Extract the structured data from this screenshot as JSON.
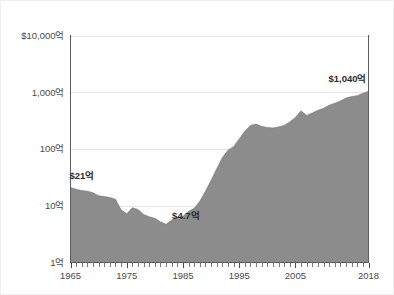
{
  "figure": {
    "background_color": "#ffffff",
    "plot_area_background": "#ffffff"
  },
  "chart_data": {
    "type": "area",
    "title": "",
    "subtitle": "",
    "xlabel": "",
    "ylabel": "",
    "yscale": "log",
    "ylim": [
      1,
      10000
    ],
    "xlim": [
      1965,
      2018
    ],
    "grid": true,
    "grid_axis": "y",
    "legend": false,
    "legend_position": "none",
    "series_color": "#8c8c8c",
    "x_tick_labels": [
      "1965",
      "1975",
      "1985",
      "1995",
      "2005",
      "2018"
    ],
    "x_tick_values": [
      1965,
      1975,
      1985,
      1995,
      2005,
      2018
    ],
    "y_tick_labels": [
      "$10,000억",
      "1,000억",
      "100억",
      "10억",
      "1억"
    ],
    "y_tick_values": [
      10000,
      1000,
      100,
      10,
      1
    ],
    "minor_tick_count_x": 53,
    "annotations": [
      {
        "text": "$21억",
        "x": 1965,
        "y": 21,
        "position": "above-left"
      },
      {
        "text": "$4.7억",
        "x": 1982,
        "y": 4.7,
        "position": "above-right"
      },
      {
        "text": "$1,040억",
        "x": 2018,
        "y": 1040,
        "position": "above-left"
      }
    ],
    "x": [
      1965,
      1966,
      1967,
      1968,
      1969,
      1970,
      1971,
      1972,
      1973,
      1974,
      1975,
      1976,
      1977,
      1978,
      1979,
      1980,
      1981,
      1982,
      1983,
      1984,
      1985,
      1986,
      1987,
      1988,
      1989,
      1990,
      1991,
      1992,
      1993,
      1994,
      1995,
      1996,
      1997,
      1998,
      1999,
      2000,
      2001,
      2002,
      2003,
      2004,
      2005,
      2006,
      2007,
      2008,
      2009,
      2010,
      2011,
      2012,
      2013,
      2014,
      2015,
      2016,
      2017,
      2018
    ],
    "values": [
      21,
      19.5,
      18.5,
      18.0,
      17.0,
      15.0,
      14.5,
      14.0,
      13.0,
      8.5,
      7.2,
      9.2,
      8.6,
      7.0,
      6.4,
      6.0,
      5.2,
      4.7,
      5.6,
      6.3,
      6.5,
      8.0,
      9.0,
      12.0,
      18.0,
      28.0,
      45.0,
      70.0,
      95.0,
      110.0,
      150.0,
      205.0,
      260.0,
      275.0,
      250.0,
      240.0,
      235.0,
      245.0,
      260.0,
      300.0,
      360.0,
      470.0,
      390.0,
      430.0,
      480.0,
      520.0,
      590.0,
      640.0,
      700.0,
      790.0,
      840.0,
      870.0,
      960.0,
      1040.0
    ],
    "series": [
      {
        "name": "값",
        "color": "#8c8c8c",
        "values": [
          21,
          19.5,
          18.5,
          18.0,
          17.0,
          15.0,
          14.5,
          14.0,
          13.0,
          8.5,
          7.2,
          9.2,
          8.6,
          7.0,
          6.4,
          6.0,
          5.2,
          4.7,
          5.6,
          6.3,
          6.5,
          8.0,
          9.0,
          12.0,
          18.0,
          28.0,
          45.0,
          70.0,
          95.0,
          110.0,
          150.0,
          205.0,
          260.0,
          275.0,
          250.0,
          240.0,
          235.0,
          245.0,
          260.0,
          300.0,
          360.0,
          470.0,
          390.0,
          430.0,
          480.0,
          520.0,
          590.0,
          640.0,
          700.0,
          790.0,
          840.0,
          870.0,
          960.0,
          1040.0
        ]
      }
    ]
  }
}
